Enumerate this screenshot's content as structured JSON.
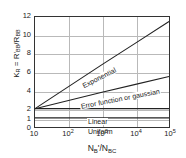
{
  "chart_data": {
    "type": "line",
    "title": "",
    "xlabel": "N_B' / N_BC",
    "ylabel": "K_R = R'_BB / R_BB",
    "x_scale": "log",
    "y_scale": "linear",
    "xlim": [
      10,
      100000
    ],
    "ylim": [
      0,
      12
    ],
    "grid": true,
    "legend_position": "inline-annotations",
    "x_ticks": [
      {
        "value": 10,
        "label": "10",
        "mantissa": "10",
        "exponent": ""
      },
      {
        "value": 100,
        "label": "10^2",
        "mantissa": "10",
        "exponent": "2"
      },
      {
        "value": 1000,
        "label": "10^3",
        "mantissa": "10",
        "exponent": "3"
      },
      {
        "value": 10000,
        "label": "10^4",
        "mantissa": "10",
        "exponent": "4"
      },
      {
        "value": 100000,
        "label": "10^5",
        "mantissa": "10",
        "exponent": "5"
      }
    ],
    "y_ticks": [
      {
        "value": 12,
        "label": "12"
      },
      {
        "value": 10,
        "label": "10"
      },
      {
        "value": 8,
        "label": "8"
      },
      {
        "value": 6,
        "label": "6"
      },
      {
        "value": 4,
        "label": "4"
      },
      {
        "value": 2,
        "label": "2"
      },
      {
        "value": 1,
        "label": "1"
      },
      {
        "value": 0,
        "label": "0"
      }
    ],
    "series": [
      {
        "name": "Exponential",
        "label": "Exponential",
        "color": "#222222",
        "x": [
          10,
          100,
          1000,
          10000,
          100000
        ],
        "values": [
          2.0,
          4.4,
          6.8,
          9.15,
          11.5
        ]
      },
      {
        "name": "Error function or gaussian",
        "label": "Error function or gaussian",
        "color": "#222222",
        "x": [
          10,
          100,
          1000,
          10000,
          100000
        ],
        "values": [
          2.0,
          2.9,
          3.8,
          4.65,
          5.5
        ]
      },
      {
        "name": "Linear",
        "label": "Linear",
        "color": "#222222",
        "x": [
          10,
          100,
          1000,
          10000,
          100000
        ],
        "values": [
          2.0,
          2.0,
          2.0,
          2.0,
          2.0
        ]
      },
      {
        "name": "Uniform",
        "label": "Uniform",
        "color": "#222222",
        "x": [
          10,
          100,
          1000,
          10000,
          100000
        ],
        "values": [
          1.0,
          1.0,
          1.0,
          1.0,
          1.0
        ]
      }
    ]
  },
  "axes": {
    "y_title": {
      "k": "K",
      "k_sub": "R",
      "eq": " = ",
      "num": "R",
      "num_prime": "'",
      "num_sub": "BB",
      "slash": "/",
      "den": "R",
      "den_sub": "BB"
    },
    "x_title": {
      "num": "N",
      "num_sub": "B",
      "num_prime": "'",
      "slash": "/",
      "den": "N",
      "den_sub": "BC"
    }
  },
  "colors": {
    "frame": "#333333",
    "grid": "#b9b9b9",
    "curve": "#222222",
    "background": "#ffffff"
  }
}
